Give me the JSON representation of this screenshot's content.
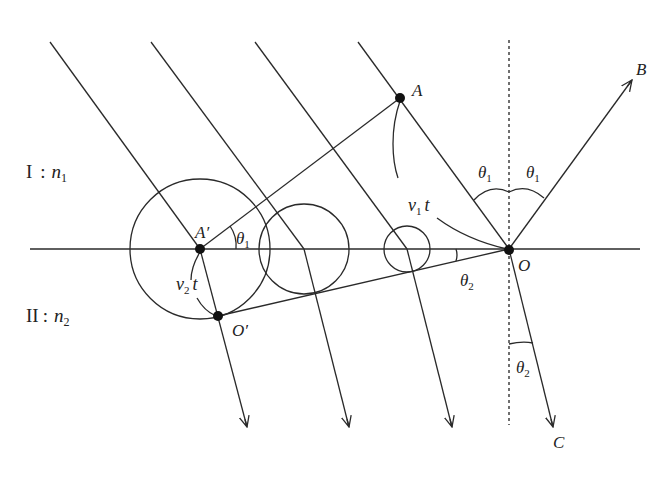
{
  "diagram": {
    "media": [
      {
        "roman": "I",
        "symbol": "n",
        "sub": "1"
      },
      {
        "roman": "II",
        "symbol": "n",
        "sub": "2"
      }
    ],
    "points": {
      "A": "A",
      "A_prime": "A′",
      "O": "O",
      "O_prime": "O′",
      "B": "B",
      "C": "C"
    },
    "labels": {
      "v1t": {
        "base": "v",
        "sub": "1",
        "suffix": "t"
      },
      "v2t": {
        "base": "v",
        "sub": "2",
        "suffix": "t"
      },
      "theta": "θ",
      "theta1_sub": "1",
      "theta2_sub": "2"
    },
    "colors": {
      "line": "#2a2a2a",
      "background": "#ffffff"
    }
  }
}
